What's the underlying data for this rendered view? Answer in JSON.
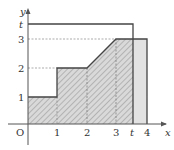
{
  "figure": {
    "type": "function-area-diagram",
    "axes": {
      "x_label": "x",
      "y_label": "y",
      "origin_label": "O",
      "x_ticks": [
        "1",
        "2",
        "3",
        "t",
        "4"
      ],
      "y_ticks": [
        "1",
        "2",
        "3",
        "t"
      ]
    },
    "curve": {
      "description": "Piecewise function: y=1 on [0,1), y=2 on [1,2], linear from (2,2) to (3,3), y=3 on [3,4]",
      "points": [
        [
          0,
          1
        ],
        [
          1,
          1
        ],
        [
          1,
          2
        ],
        [
          2,
          2
        ],
        [
          3,
          3
        ],
        [
          4,
          3
        ]
      ]
    },
    "regions": [
      {
        "name": "hatched-area",
        "description": "Area under curve from x=0 to x=t",
        "from": 0,
        "to": "t"
      },
      {
        "name": "gray-area",
        "description": "Area under curve from x=t to x=4",
        "from": "t",
        "to": 4
      },
      {
        "name": "rectangle-t",
        "description": "Rectangle with corners (0,0) and (t,t)"
      }
    ],
    "colors": {
      "axis": "#555555",
      "curve": "#444444",
      "hatch_fill": "#d6d6d6",
      "hatch_line": "#9a9a9a",
      "gray_fill": "#e2e2e2",
      "dashed": "#888888"
    }
  },
  "labels": {
    "x": "x",
    "y": "y",
    "O": "O",
    "x1": "1",
    "x2": "2",
    "x3": "3",
    "xt": "t",
    "x4": "4",
    "y1": "1",
    "y2": "2",
    "y3": "3",
    "yt": "t"
  }
}
